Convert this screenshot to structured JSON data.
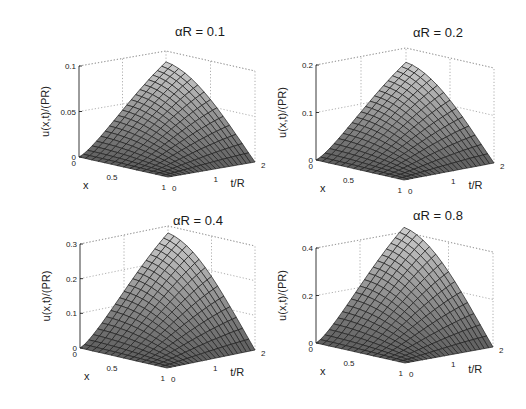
{
  "figure": {
    "layout": "2x2 grid of 3D surface plots",
    "colormap": "gray",
    "grid_style": "dotted"
  },
  "chart_data": [
    {
      "type": "surface",
      "title": "αR = 0.1",
      "xlabel": "x",
      "ylabel": "t/R",
      "zlabel": "u(x,t)/(PR)",
      "x_ticks": [
        "0",
        "0.5",
        "1"
      ],
      "t_ticks": [
        "0",
        "1",
        "2"
      ],
      "z_ticks": [
        "0",
        "0.05",
        "0.1"
      ],
      "xlim": [
        0,
        1
      ],
      "tlim": [
        0,
        2
      ],
      "zlim": [
        0,
        0.1
      ],
      "peak": {
        "x": 0,
        "t": 2,
        "u": 0.088
      },
      "description": "u is 0 at t=0 and at x=1; rises with t, maximum at x=0, t=2"
    },
    {
      "type": "surface",
      "title": "αR = 0.2",
      "xlabel": "x",
      "ylabel": "t/R",
      "zlabel": "u(x,t)/(PR)",
      "x_ticks": [
        "0",
        "0.5",
        "1"
      ],
      "t_ticks": [
        "0",
        "1",
        "2"
      ],
      "z_ticks": [
        "0",
        "0.1",
        "0.2"
      ],
      "xlim": [
        0,
        1
      ],
      "tlim": [
        0,
        2
      ],
      "zlim": [
        0,
        0.2
      ],
      "peak": {
        "x": 0,
        "t": 2,
        "u": 0.17
      },
      "description": "u is 0 at t=0 and at x=1; rises with t, maximum at x=0, t=2"
    },
    {
      "type": "surface",
      "title": "αR = 0.4",
      "xlabel": "x",
      "ylabel": "t/R",
      "zlabel": "u(x,t)/(PR)",
      "x_ticks": [
        "0",
        "0.5",
        "1"
      ],
      "t_ticks": [
        "0",
        "1",
        "2"
      ],
      "z_ticks": [
        "0",
        "0.1",
        "0.2",
        "0.3"
      ],
      "xlim": [
        0,
        1
      ],
      "tlim": [
        0,
        2
      ],
      "zlim": [
        0,
        0.3
      ],
      "peak": {
        "x": 0,
        "t": 2,
        "u": 0.28
      },
      "description": "u is 0 at t=0 and at x=1; rises with t, maximum at x=0, t=2"
    },
    {
      "type": "surface",
      "title": "αR = 0.8",
      "xlabel": "x",
      "ylabel": "t/R",
      "zlabel": "u(x,t)/(PR)",
      "x_ticks": [
        "0",
        "0.5",
        "1"
      ],
      "t_ticks": [
        "0",
        "1",
        "2"
      ],
      "z_ticks": [
        "0",
        "0.2",
        "0.4"
      ],
      "xlim": [
        0,
        1
      ],
      "tlim": [
        0,
        2
      ],
      "zlim": [
        0,
        0.4
      ],
      "peak": {
        "x": 0,
        "t": 2,
        "u": 0.42
      },
      "description": "u is 0 at t=0 and at x=1; rises with t, maximum at x=0, t=2"
    }
  ],
  "panels_geometry": [
    {
      "origin": [
        79,
        157
      ],
      "front": [
        168,
        177
      ],
      "right": [
        255,
        162
      ],
      "ztop_y": 66,
      "title_pos": [
        200,
        36
      ]
    },
    {
      "origin": [
        316,
        160
      ],
      "front": [
        404,
        180
      ],
      "right": [
        494,
        163
      ],
      "ztop_y": 65,
      "title_pos": [
        438,
        37
      ]
    },
    {
      "origin": [
        80,
        348
      ],
      "front": [
        167,
        368
      ],
      "right": [
        255,
        350
      ],
      "ztop_y": 244,
      "title_pos": [
        198,
        225
      ]
    },
    {
      "origin": [
        316,
        343
      ],
      "front": [
        405,
        363
      ],
      "right": [
        493,
        347
      ],
      "ztop_y": 248,
      "title_pos": [
        438,
        220
      ]
    }
  ]
}
